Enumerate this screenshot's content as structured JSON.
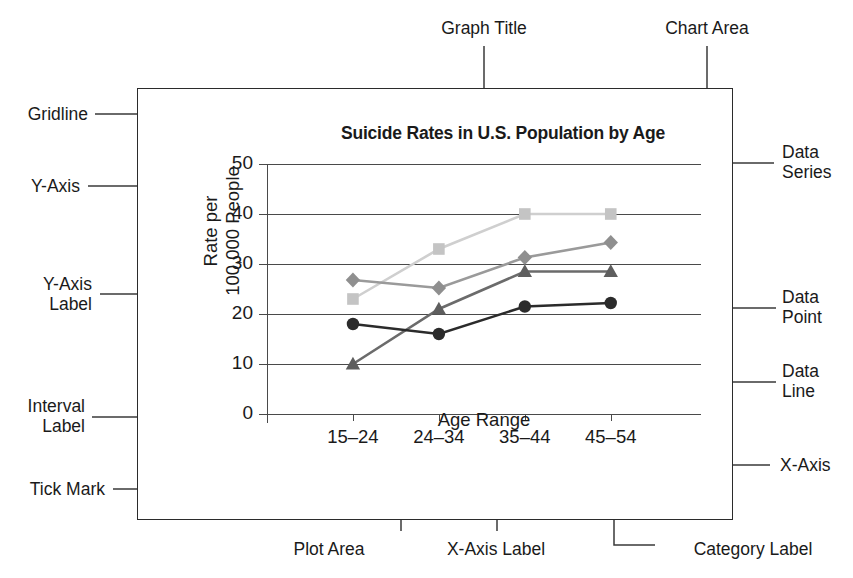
{
  "annotations": {
    "graph_title": "Graph Title",
    "chart_area": "Chart Area",
    "gridline": "Gridline",
    "y_axis": "Y-Axis",
    "y_axis_label": "Y-Axis\nLabel",
    "interval_label": "Interval\nLabel",
    "tick_mark": "Tick Mark",
    "data_series": "Data\nSeries",
    "data_point": "Data\nPoint",
    "data_line": "Data\nLine",
    "x_axis": "X-Axis",
    "plot_area": "Plot Area",
    "x_axis_label_anno": "X-Axis Label",
    "category_label": "Category Label"
  },
  "chart_data": {
    "type": "line",
    "title": "Suicide Rates in U.S. Population by Age",
    "xlabel": "Age Range",
    "ylabel": "Rate per\n100,000 People",
    "categories": [
      "15–24",
      "24–34",
      "35–44",
      "45–54"
    ],
    "ytick_labels": [
      "0",
      "10",
      "20",
      "30",
      "40",
      "50"
    ],
    "ytick_values": [
      0,
      10,
      20,
      30,
      40,
      50
    ],
    "ylim": [
      0,
      50
    ],
    "grid": true,
    "legend": "none",
    "series": [
      {
        "name": "series-square-light",
        "marker": "square",
        "color": "#c4c4c4",
        "line_color": "#cfcfcf",
        "values": [
          23.0,
          33.0,
          40.0,
          40.0
        ]
      },
      {
        "name": "series-diamond-gray",
        "marker": "diamond",
        "color": "#8f8f8f",
        "line_color": "#9a9a9a",
        "values": [
          26.8,
          25.2,
          31.3,
          34.3
        ]
      },
      {
        "name": "series-triangle-dark",
        "marker": "triangle",
        "color": "#5e5e5e",
        "line_color": "#6b6b6b",
        "values": [
          10.0,
          21.0,
          28.5,
          28.5
        ]
      },
      {
        "name": "series-circle-black",
        "marker": "circle",
        "color": "#2b2b2b",
        "line_color": "#2b2b2b",
        "values": [
          18.0,
          16.0,
          21.5,
          22.2
        ]
      }
    ]
  },
  "colors": {
    "ink": "#1a1a1a",
    "leader": "#3a3a3a",
    "grid": "#4a4a4a",
    "border": "#2b2b2b"
  }
}
